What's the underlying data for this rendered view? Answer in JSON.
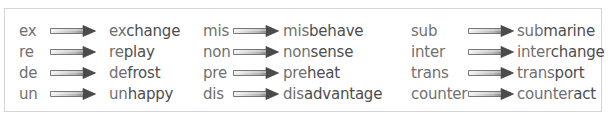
{
  "colors": {
    "border": "#d4d4d4",
    "prefix_text": "#707070",
    "root_text": "#4e4e4e",
    "arrow_light": "#f2f2f2",
    "arrow_dark": "#555555"
  },
  "columns": [
    {
      "rows": [
        {
          "prefix": "ex",
          "word_prefix": "ex",
          "word_root": "change",
          "word": "exchange"
        },
        {
          "prefix": "re",
          "word_prefix": "re",
          "word_root": "play",
          "word": "replay"
        },
        {
          "prefix": "de",
          "word_prefix": "de",
          "word_root": "frost",
          "word": "defrost"
        },
        {
          "prefix": "un",
          "word_prefix": "un",
          "word_root": "happy",
          "word": "unhappy"
        }
      ]
    },
    {
      "rows": [
        {
          "prefix": "mis",
          "word_prefix": "mis",
          "word_root": "behave",
          "word": "misbehave"
        },
        {
          "prefix": "non",
          "word_prefix": "non",
          "word_root": "sense",
          "word": "nonsense"
        },
        {
          "prefix": "pre",
          "word_prefix": "pre",
          "word_root": "heat",
          "word": "preheat"
        },
        {
          "prefix": "dis",
          "word_prefix": "dis",
          "word_root": "advantage",
          "word": "disadvantage"
        }
      ]
    },
    {
      "rows": [
        {
          "prefix": "sub",
          "word_prefix": "sub",
          "word_root": "marine",
          "word": "submarine"
        },
        {
          "prefix": "inter",
          "word_prefix": "inter",
          "word_root": "change",
          "word": "interchange"
        },
        {
          "prefix": "trans",
          "word_prefix": "trans",
          "word_root": "port",
          "word": "transport"
        },
        {
          "prefix": "counter",
          "word_prefix": "counter",
          "word_root": "act",
          "word": "counteract"
        }
      ]
    }
  ],
  "icons": {
    "arrow": "right-arrow-icon"
  }
}
